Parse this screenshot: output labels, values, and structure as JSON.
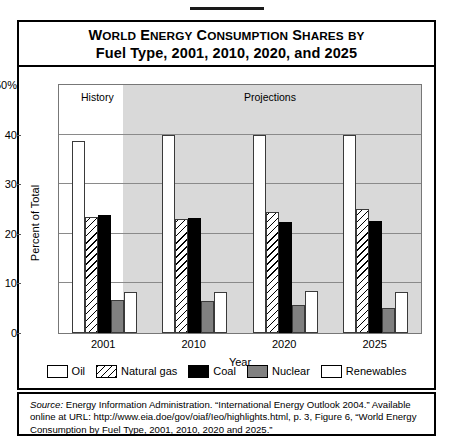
{
  "figure": {
    "title_line1": "World Energy Consumption Shares by",
    "title_line2": "Fuel Type, 2001, 2010, 2020, and 2025",
    "history_label": "History",
    "projections_label": "Projections",
    "y_axis_title": "Percent of Total",
    "x_axis_title": "Year",
    "y_tick_top": "50%",
    "source_prefix": "Source:",
    "source_body": " Energy Information Administration. “International Energy Outlook 2004.” Available online at URL: http://www.eia.doe/gov/oiaf/Ieo/highlights.html, p. 3, Figure 6, “World Energy Consumption by Fuel Type, 2001, 2010, 2020 and 2025.”"
  },
  "legend": {
    "items": [
      {
        "label": "Oil",
        "pattern": "white",
        "icon": "square-white-icon"
      },
      {
        "label": "Natural gas",
        "pattern": "hatch",
        "icon": "square-hatched-icon"
      },
      {
        "label": "Coal",
        "pattern": "black",
        "icon": "square-black-icon"
      },
      {
        "label": "Nuclear",
        "pattern": "gray",
        "icon": "square-gray-icon"
      },
      {
        "label": "Renewables",
        "pattern": "dotted",
        "icon": "square-dotted-icon"
      }
    ]
  },
  "chart_data": {
    "type": "bar",
    "title": "World Energy Consumption Shares by Fuel Type, 2001, 2010, 2020, and 2025",
    "xlabel": "Year",
    "ylabel": "Percent of Total",
    "ylim": [
      0,
      50
    ],
    "yticks": [
      0,
      10,
      20,
      30,
      40,
      50
    ],
    "ytick_labels": [
      "0",
      "10",
      "20",
      "30",
      "40",
      "50%"
    ],
    "grid": true,
    "legend_position": "bottom",
    "categories": [
      "2001",
      "2010",
      "2020",
      "2025"
    ],
    "history_categories": [
      "2001"
    ],
    "projection_categories": [
      "2010",
      "2020",
      "2025"
    ],
    "series": [
      {
        "name": "Oil",
        "values": [
          38.7,
          40.0,
          40.0,
          40.0
        ]
      },
      {
        "name": "Natural gas",
        "values": [
          23.3,
          23.0,
          24.3,
          25.0
        ]
      },
      {
        "name": "Coal",
        "values": [
          23.8,
          23.1,
          22.3,
          22.5
        ]
      },
      {
        "name": "Nuclear",
        "values": [
          6.7,
          6.5,
          5.6,
          5.0
        ]
      },
      {
        "name": "Renewables",
        "values": [
          8.2,
          8.3,
          8.4,
          8.3
        ]
      }
    ]
  }
}
